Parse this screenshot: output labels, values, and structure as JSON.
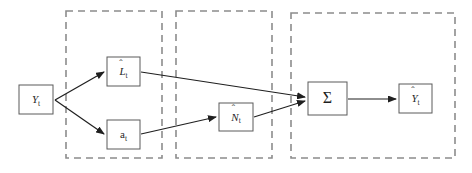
{
  "diagram": {
    "colors": {
      "node_stroke": "#5a5a5a",
      "group_stroke": "#8c8c8c",
      "edge": "#1f1f1f",
      "text": "#1f1f1f",
      "group_text": "#3a3a3a",
      "background": "#ffffff"
    },
    "groups": [
      {
        "id": "statistical-method",
        "title_line1": "Statistical Method",
        "title_line2": "(TSR)",
        "x": 66,
        "y": 11,
        "w": 96,
        "h": 147
      },
      {
        "id": "machine-learning",
        "title_line1": "Machine Learning",
        "title_line2": "(FFNN/LSTM)",
        "x": 176,
        "y": 11,
        "w": 96,
        "h": 147
      },
      {
        "id": "hybrid",
        "title_line1": "Hybrid",
        "title_line2": "",
        "x": 291,
        "y": 13,
        "w": 164,
        "h": 145
      }
    ],
    "nodes": [
      {
        "id": "input-yt",
        "label": "Y",
        "subscript": "t",
        "hat": false,
        "italic": true,
        "x": 19,
        "y": 85,
        "w": 34,
        "h": 29
      },
      {
        "id": "linear-lt",
        "label": "L",
        "subscript": "t",
        "hat": true,
        "italic": true,
        "x": 107,
        "y": 57,
        "w": 33,
        "h": 29
      },
      {
        "id": "residual-at",
        "label": "a",
        "subscript": "t",
        "hat": false,
        "italic": false,
        "x": 107,
        "y": 120,
        "w": 33,
        "h": 29
      },
      {
        "id": "nonlinear-nt",
        "label": "N",
        "subscript": "t",
        "hat": true,
        "italic": true,
        "x": 219,
        "y": 103,
        "w": 34,
        "h": 28
      },
      {
        "id": "summation",
        "label": "Σ",
        "subscript": "",
        "hat": false,
        "italic": false,
        "x": 308,
        "y": 82,
        "w": 39,
        "h": 33
      },
      {
        "id": "output-yhat",
        "label": "Y",
        "subscript": "t",
        "hat": true,
        "italic": true,
        "x": 399,
        "y": 84,
        "w": 33,
        "h": 29
      }
    ],
    "edges": [
      {
        "id": "yt-to-lt",
        "from": "input-yt",
        "to": "linear-lt",
        "d": "M 55 100 L 104 72"
      },
      {
        "id": "yt-to-at",
        "from": "input-yt",
        "to": "residual-at",
        "d": "M 55 100 L 104 134"
      },
      {
        "id": "lt-to-sum",
        "from": "linear-lt",
        "to": "summation",
        "d": "M 141 72 L 305 97"
      },
      {
        "id": "at-to-nt",
        "from": "residual-at",
        "to": "nonlinear-nt",
        "d": "M 141 134 L 216 117"
      },
      {
        "id": "nt-to-sum",
        "from": "nonlinear-nt",
        "to": "summation",
        "d": "M 254 117 L 305 101"
      },
      {
        "id": "sum-to-yhat",
        "from": "summation",
        "to": "output-yhat",
        "d": "M 348 99 L 396 99"
      }
    ]
  }
}
